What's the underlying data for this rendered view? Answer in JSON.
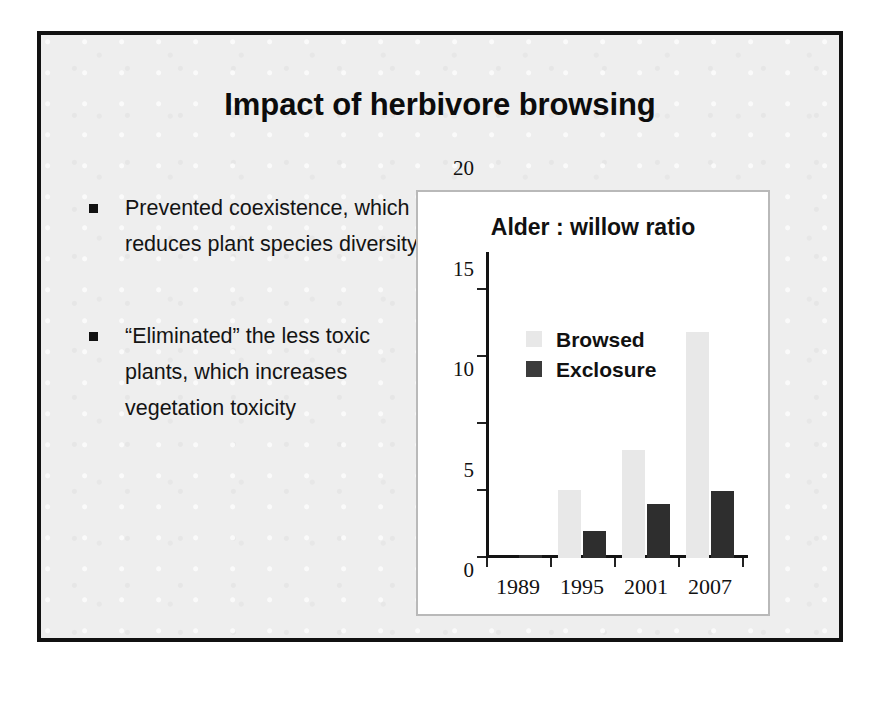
{
  "slide": {
    "title": "Impact of herbivore browsing",
    "bullets": [
      {
        "marker": "square-bullet",
        "text": "Prevented coexistence, which reduces plant species diversity"
      },
      {
        "marker": "square-bullet",
        "text": "“Eliminated” the less toxic plants, which increases vegetation toxicity"
      }
    ]
  },
  "colors": {
    "slide_background": "#eeeeee",
    "slide_border": "#111111",
    "chart_panel_background": "#ffffff",
    "chart_panel_border": "#b9b9b9",
    "browsed_series": "#e8e8e8",
    "exclosure_series": "#2e2e2e",
    "axis": "#131313",
    "text": "#111111"
  },
  "chart_data": {
    "type": "bar",
    "title": "Alder : willow ratio",
    "xlabel": "",
    "ylabel": "",
    "categories": [
      "1989",
      "1995",
      "2001",
      "2007"
    ],
    "series": [
      {
        "name": "Browsed",
        "values": [
          0,
          5.1,
          8.1,
          16.9
        ]
      },
      {
        "name": "Exclosure",
        "values": [
          0.2,
          2.0,
          4.0,
          5.0
        ]
      }
    ],
    "ylim": [
      0,
      21.5
    ],
    "yticks": [
      0,
      5,
      10,
      15,
      20
    ],
    "ytick_labels": [
      "0",
      "5",
      "10",
      "15",
      "20"
    ],
    "grid": false,
    "legend": {
      "position": "upper-left-inside",
      "entries": [
        "Browsed",
        "Exclosure"
      ]
    }
  }
}
